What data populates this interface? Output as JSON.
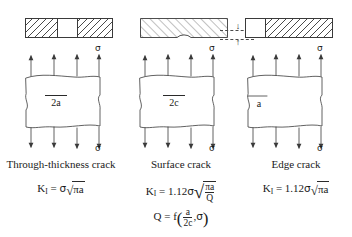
{
  "figure": {
    "columns": [
      {
        "id": "through-thickness",
        "caption": "Through-thickness crack",
        "section": {
          "type": "through-thickness-section",
          "segments": [
            "hatched",
            "blank",
            "hatched"
          ]
        },
        "plate": {
          "crack_label": "2a",
          "crack_label_position": "center",
          "top_stress_label": "σ",
          "bottom_stress_label": "σ",
          "arrow_count_top": 4,
          "arrow_count_bottom": 4
        },
        "formula": {
          "lhs": "K",
          "lhs_sub": "I",
          "equals": "=",
          "coefficient": "",
          "sigma": "σ",
          "radicand": "πa",
          "plain": "K_I = σ√(πa)"
        }
      },
      {
        "id": "surface",
        "caption": "Surface crack",
        "section": {
          "type": "surface-section",
          "segments": [
            "hatched"
          ],
          "notch": "semicircular",
          "depth_label": "a",
          "arrow_down": "↓",
          "arrow_up": "↑",
          "dashed_guides": 2
        },
        "plate": {
          "crack_label": "2c",
          "crack_label_position": "center",
          "top_stress_label": "σ",
          "bottom_stress_label": "σ",
          "arrow_count_top": 4,
          "arrow_count_bottom": 4
        },
        "formula": {
          "lhs": "K",
          "lhs_sub": "I",
          "equals": "=",
          "coefficient": "1.12",
          "sigma": "σ",
          "numerator": "πa",
          "denominator": "Q",
          "plain": "K_I = 1.12σ√(πa/Q)"
        },
        "formula_sub": {
          "lhs": "Q",
          "equals": "=",
          "func": "f",
          "arg_num": "a",
          "arg_den": "2c",
          "arg_sep": ",",
          "arg_second": "σ",
          "plain": "Q = f(a/2c, σ)"
        }
      },
      {
        "id": "edge",
        "caption": "Edge crack",
        "section": {
          "type": "edge-section",
          "segments": [
            "blank",
            "hatched"
          ]
        },
        "plate": {
          "crack_label": "a",
          "crack_label_position": "left-edge",
          "top_stress_label": "σ",
          "bottom_stress_label": "σ",
          "arrow_count_top": 4,
          "arrow_count_bottom": 4
        },
        "formula": {
          "lhs": "K",
          "lhs_sub": "I",
          "equals": "=",
          "coefficient": "1.12",
          "sigma": "σ",
          "radicand": "πa",
          "plain": "K_I = 1.12σ√(πa)"
        }
      }
    ],
    "colors": {
      "line": "#3a3a3a",
      "hatch": "#4a4a4a",
      "text": "#1a1a1a",
      "background": "#ffffff"
    }
  }
}
